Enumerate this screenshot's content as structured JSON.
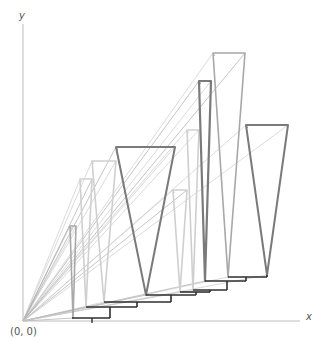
{
  "labels": {
    "y_axis": "y",
    "x_axis": "x",
    "origin": "(0, 0)"
  },
  "colors": {
    "axis": "#bdbdbd",
    "light": "#cfcfcf",
    "mid": "#a8a8a8",
    "dark": "#7a7a7a",
    "stair": "#2e2e2e",
    "ray": "#c8c8c8"
  },
  "axes": {
    "origin": [
      23,
      321
    ],
    "x_end": [
      300,
      321
    ],
    "y_end": [
      23,
      24
    ]
  },
  "stairs": [
    {
      "x1": 72,
      "y1": 318,
      "x2": 110,
      "y2": 318,
      "riser_to": 307
    },
    {
      "x1": 86,
      "y1": 307,
      "x2": 137,
      "y2": 307,
      "riser_to": 302
    },
    {
      "x1": 104,
      "y1": 302,
      "x2": 171,
      "y2": 302,
      "riser_to": 295
    },
    {
      "x1": 146,
      "y1": 295,
      "x2": 196,
      "y2": 295,
      "riser_to": 292
    },
    {
      "x1": 180,
      "y1": 292,
      "x2": 210,
      "y2": 292,
      "riser_to": 290
    },
    {
      "x1": 193,
      "y1": 290,
      "x2": 227,
      "y2": 290,
      "riser_to": 281
    },
    {
      "x1": 205,
      "y1": 281,
      "x2": 246,
      "y2": 281,
      "riser_to": 277
    },
    {
      "x1": 228,
      "y1": 277,
      "x2": 267,
      "y2": 277,
      "riser_to": 275
    }
  ],
  "shapes": [
    {
      "name": "trap-1",
      "tl": [
        70,
        226
      ],
      "tr": [
        76,
        226
      ],
      "b": [
        73,
        318
      ],
      "tone": "mid",
      "w": 1.6
    },
    {
      "name": "trap-2",
      "tl": [
        80,
        179
      ],
      "tr": [
        92,
        179
      ],
      "b": [
        86,
        307
      ],
      "tone": "light",
      "w": 1.6
    },
    {
      "name": "trap-3",
      "tl": [
        92,
        161
      ],
      "tr": [
        116,
        161
      ],
      "b": [
        104,
        302
      ],
      "tone": "light",
      "w": 1.6
    },
    {
      "name": "trap-4",
      "tl": [
        116,
        147
      ],
      "tr": [
        175,
        147
      ],
      "b": [
        146,
        295
      ],
      "tone": "dark",
      "w": 2
    },
    {
      "name": "trap-5",
      "tl": [
        173,
        190
      ],
      "tr": [
        187,
        190
      ],
      "b": [
        180,
        292
      ],
      "tone": "light",
      "w": 1.6
    },
    {
      "name": "trap-6",
      "tl": [
        187,
        130
      ],
      "tr": [
        199,
        130
      ],
      "b": [
        193,
        290
      ],
      "tone": "light",
      "w": 1.6
    },
    {
      "name": "trap-7",
      "tl": [
        199,
        81
      ],
      "tr": [
        211,
        81
      ],
      "b": [
        205,
        281
      ],
      "tone": "dark",
      "w": 2.2
    },
    {
      "name": "trap-8",
      "tl": [
        213,
        53
      ],
      "tr": [
        245,
        53
      ],
      "b": [
        228,
        277
      ],
      "tone": "mid",
      "w": 1.6
    },
    {
      "name": "trap-9",
      "tl": [
        246,
        125
      ],
      "tr": [
        288,
        125
      ],
      "b": [
        267,
        275
      ],
      "tone": "dark",
      "w": 2
    }
  ],
  "rays": [
    [
      70,
      226
    ],
    [
      76,
      226
    ],
    [
      80,
      179
    ],
    [
      92,
      179
    ],
    [
      92,
      161
    ],
    [
      116,
      161
    ],
    [
      116,
      147
    ],
    [
      175,
      147
    ],
    [
      173,
      190
    ],
    [
      187,
      190
    ],
    [
      187,
      130
    ],
    [
      199,
      130
    ],
    [
      199,
      81
    ],
    [
      211,
      81
    ],
    [
      213,
      53
    ],
    [
      245,
      53
    ],
    [
      246,
      125
    ],
    [
      288,
      125
    ],
    [
      73,
      318
    ],
    [
      86,
      307
    ],
    [
      104,
      302
    ],
    [
      146,
      295
    ],
    [
      180,
      292
    ],
    [
      193,
      290
    ],
    [
      205,
      281
    ],
    [
      228,
      277
    ],
    [
      267,
      275
    ]
  ]
}
